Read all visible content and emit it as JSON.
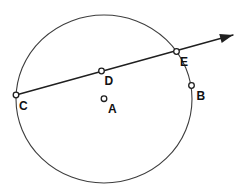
{
  "figure": {
    "background_color": "#ffffff",
    "ray_color": "#1f1f1f",
    "circle_color": "#3d3d3d",
    "label_color": "#111111",
    "marker_fill": "#ffffff",
    "marker_stroke": "#1f1f1f",
    "circle": {
      "cx": 104,
      "cy": 99,
      "rx": 88,
      "ry": 84
    },
    "ray": {
      "x1": 16,
      "y1": 95,
      "x2": 233,
      "y2": 35
    },
    "points": {
      "C": {
        "label": "C",
        "x": 16,
        "y": 95,
        "label_x": 19,
        "label_y": 110
      },
      "D": {
        "label": "D",
        "x": 101.5,
        "y": 71,
        "label_x": 104.5,
        "label_y": 85
      },
      "A": {
        "label": "A",
        "x": 104,
        "y": 98.7,
        "label_x": 108,
        "label_y": 113
      },
      "E": {
        "label": "E",
        "x": 176.5,
        "y": 51.5,
        "label_x": 180,
        "label_y": 66
      },
      "B": {
        "label": "B",
        "x": 191.5,
        "y": 85.5,
        "label_x": 196.5,
        "label_y": 100
      }
    }
  }
}
